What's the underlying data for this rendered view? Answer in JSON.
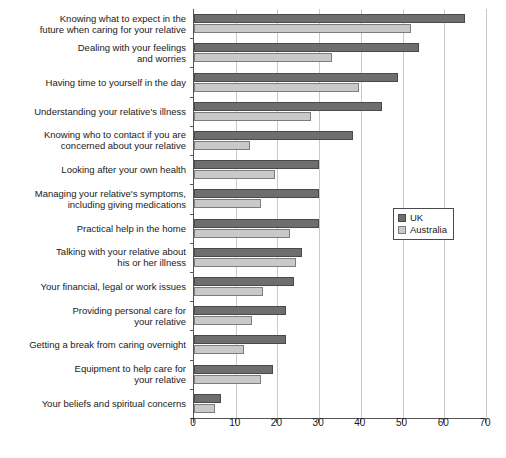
{
  "chart_data": {
    "type": "bar",
    "orientation": "horizontal",
    "title": "",
    "xlabel": "",
    "ylabel": "",
    "xlim": [
      0,
      70
    ],
    "xticks": [
      0,
      10,
      20,
      30,
      40,
      50,
      60,
      70
    ],
    "grid": true,
    "legend_position": "middle-right",
    "categories": [
      "Knowing what to expect in the\nfuture when caring for your relative",
      "Dealing with your feelings\nand worries",
      "Having time to yourself in the day",
      "Understanding your relative's illness",
      "Knowing who to contact if you are\nconcerned about your relative",
      "Looking after your own health",
      "Managing your relative's symptoms,\nincluding giving medications",
      "Practical help in the home",
      "Talking with your relative about\nhis or her illness",
      "Your financial, legal or work issues",
      "Providing personal care for\nyour relative",
      "Getting a break from caring overnight",
      "Equipment to help care for\nyour relative",
      "Your beliefs and spiritual concerns"
    ],
    "series": [
      {
        "name": "UK",
        "color": "#6e6e6e",
        "values": [
          65,
          54,
          49,
          45,
          38,
          30,
          30,
          30,
          26,
          24,
          22,
          22,
          19,
          6.5
        ]
      },
      {
        "name": "Australia",
        "color": "#c9c9c9",
        "values": [
          52,
          33,
          39.5,
          28,
          13.5,
          19.5,
          16,
          23,
          24.5,
          16.5,
          14,
          12,
          16,
          5
        ]
      }
    ]
  },
  "legend": {
    "items": [
      {
        "label": "UK"
      },
      {
        "label": "Australia"
      }
    ]
  }
}
